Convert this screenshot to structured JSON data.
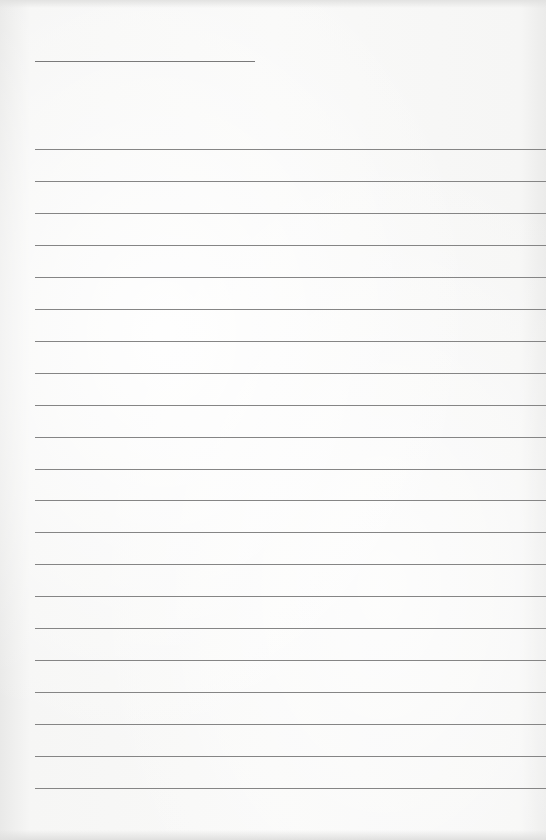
{
  "page": {
    "type": "lined-paper",
    "background_color": "#f4f4f3",
    "line_color": "#858585"
  },
  "title_line": {
    "top": 61,
    "left": 35,
    "width": 220
  },
  "rule_lines": {
    "count": 21,
    "first_top": 149,
    "spacing": 31.95,
    "left": 35
  }
}
